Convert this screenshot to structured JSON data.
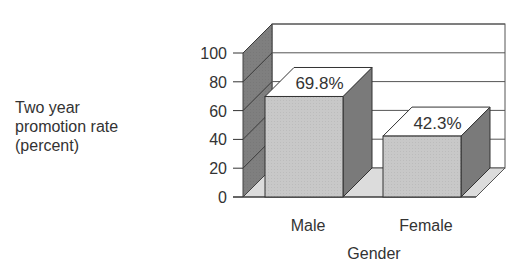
{
  "chart_data": {
    "type": "bar",
    "style": "3d",
    "title": "",
    "categories": [
      "Male",
      "Female"
    ],
    "values": [
      69.8,
      42.3
    ],
    "data_labels": [
      "69.8%",
      "42.3%"
    ],
    "xlabel": "Gender",
    "ylabel_lines": [
      "Two year",
      "promotion rate",
      "(percent)"
    ],
    "ylabel": "Two year promotion rate (percent)",
    "ylim": [
      0,
      100
    ],
    "yticks": [
      0,
      20,
      40,
      60,
      80,
      100
    ],
    "grid": true,
    "legend": null
  },
  "colors": {
    "bar_front": "#c8c8c8",
    "bar_side": "#7a7a7a",
    "bar_top": "#ffffff",
    "wall_left": "#7f7f7f",
    "floor": "#dcdcdc",
    "grid": "#555555",
    "text": "#333333"
  }
}
